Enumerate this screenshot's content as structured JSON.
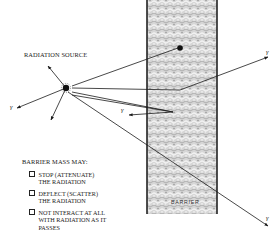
{
  "diagram": {
    "source_label": "RADIATION SOURCE",
    "barrier_label": "BARRIER",
    "gamma_symbol": "γ",
    "barrier_heading": "BARRIER MASS MAY:",
    "barrier_effects": [
      "STOP (ATTENUATE)\nTHE RADIATION",
      "DEFLECT (SCATTER)\nTHE RADIATION",
      "NOT INTERACT AT ALL\nWITH RADIATION AS IT\nPASSES"
    ],
    "colors": {
      "line": "#1a1a1a",
      "barrier_fill": "#c8c8c8",
      "barrier_edge": "#222222",
      "background": "#ffffff"
    }
  }
}
